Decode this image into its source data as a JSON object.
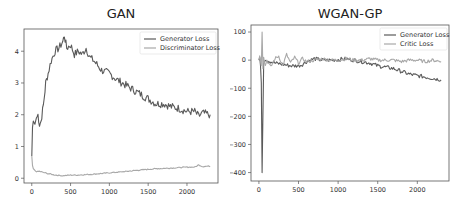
{
  "chart_data": [
    {
      "type": "line",
      "title": "GAN",
      "xlabel": "",
      "ylabel": "",
      "xlim": [
        -100,
        2400
      ],
      "ylim": [
        -0.15,
        4.7
      ],
      "xticks": [
        0,
        500,
        1000,
        1500,
        2000
      ],
      "yticks": [
        0,
        1,
        2,
        3,
        4
      ],
      "grid": false,
      "legend_position": "upper right",
      "series": [
        {
          "name": "Generator Loss",
          "color": "#5a5a5a",
          "x": [
            0,
            10,
            20,
            40,
            60,
            80,
            100,
            120,
            150,
            180,
            210,
            250,
            300,
            350,
            400,
            420,
            450,
            500,
            550,
            600,
            650,
            700,
            750,
            800,
            900,
            1000,
            1100,
            1200,
            1300,
            1400,
            1500,
            1600,
            1700,
            1800,
            1900,
            2000,
            2100,
            2150,
            2200,
            2300
          ],
          "y": [
            0.7,
            1.6,
            1.8,
            1.7,
            1.9,
            2.0,
            1.7,
            1.8,
            2.3,
            3.0,
            3.3,
            3.7,
            4.0,
            4.1,
            4.3,
            4.5,
            4.1,
            4.2,
            3.9,
            4.0,
            3.9,
            4.1,
            3.8,
            3.7,
            3.4,
            3.3,
            3.1,
            2.95,
            2.8,
            2.65,
            2.5,
            2.35,
            2.35,
            2.25,
            2.2,
            2.1,
            2.1,
            1.95,
            2.05,
            2.0
          ]
        },
        {
          "name": "Discriminator Loss",
          "color": "#a8a8a8",
          "x": [
            0,
            10,
            20,
            40,
            60,
            100,
            150,
            200,
            300,
            400,
            500,
            600,
            800,
            1000,
            1200,
            1400,
            1600,
            1800,
            2000,
            2100,
            2150,
            2200,
            2300
          ],
          "y": [
            0.7,
            0.4,
            0.3,
            0.25,
            0.2,
            0.22,
            0.18,
            0.15,
            0.1,
            0.08,
            0.1,
            0.1,
            0.13,
            0.17,
            0.21,
            0.26,
            0.3,
            0.32,
            0.35,
            0.35,
            0.42,
            0.37,
            0.38
          ]
        }
      ]
    },
    {
      "type": "line",
      "title": "WGAN-GP",
      "xlabel": "",
      "ylabel": "",
      "xlim": [
        -100,
        2400
      ],
      "ylim": [
        -430,
        125
      ],
      "xticks": [
        0,
        500,
        1000,
        1500,
        2000
      ],
      "yticks": [
        100,
        0,
        -100,
        -200,
        -300,
        -400
      ],
      "grid": false,
      "legend_position": "upper right",
      "series": [
        {
          "name": "Generator Loss",
          "color": "#5a5a5a",
          "x": [
            0,
            10,
            20,
            30,
            40,
            50,
            60,
            80,
            100,
            150,
            200,
            300,
            400,
            500,
            550,
            600,
            700,
            800,
            900,
            1000,
            1100,
            1200,
            1300,
            1400,
            1500,
            1600,
            1700,
            1800,
            1900,
            2000,
            2100,
            2200,
            2300
          ],
          "y": [
            0,
            10,
            -20,
            -80,
            -400,
            -200,
            -10,
            5,
            0,
            -5,
            -10,
            -15,
            -20,
            -20,
            -15,
            -5,
            5,
            0,
            0,
            2,
            5,
            0,
            -5,
            -10,
            -20,
            -25,
            -30,
            -40,
            -50,
            -55,
            -60,
            -65,
            -70
          ]
        },
        {
          "name": "Critic Loss",
          "color": "#a8a8a8",
          "x": [
            0,
            10,
            20,
            30,
            40,
            50,
            60,
            80,
            100,
            150,
            200,
            250,
            300,
            350,
            400,
            450,
            500,
            550,
            600,
            700,
            800,
            900,
            1000,
            1100,
            1200,
            1300,
            1400,
            1500,
            1600,
            1700,
            1800,
            1900,
            2000,
            2100,
            2200,
            2300
          ],
          "y": [
            0,
            15,
            0,
            -20,
            100,
            -30,
            10,
            -20,
            0,
            -25,
            5,
            15,
            -20,
            20,
            -10,
            10,
            -10,
            5,
            -5,
            0,
            5,
            0,
            0,
            5,
            0,
            0,
            5,
            0,
            0,
            0,
            -5,
            0,
            0,
            -5,
            0,
            -5
          ]
        }
      ]
    }
  ],
  "charts": {
    "left": {
      "title": "GAN",
      "legend": [
        "Generator Loss",
        "Discriminator Loss"
      ],
      "xtick_labels": [
        "0",
        "500",
        "1000",
        "1500",
        "2000"
      ],
      "ytick_labels": [
        "0",
        "1",
        "2",
        "3",
        "4"
      ]
    },
    "right": {
      "title": "WGAN-GP",
      "legend": [
        "Generator Loss",
        "Critic Loss"
      ],
      "xtick_labels": [
        "0",
        "500",
        "1000",
        "1500",
        "2000"
      ],
      "ytick_labels": [
        "100",
        "0",
        "−100",
        "−200",
        "−300",
        "−400"
      ]
    }
  }
}
